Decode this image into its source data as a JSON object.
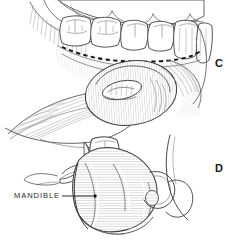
{
  "figure": {
    "background_color": "#ffffff",
    "ink_color": "#333333",
    "width": 234,
    "height": 245
  },
  "panels": [
    {
      "id": "C",
      "letter": "C",
      "description": "Intraoral view of mandibular dental arch with dashed incision line along the lingual gingival margin and hatched tongue mass in the floor of the mouth"
    },
    {
      "id": "D",
      "letter": "D",
      "description": "Lateral view of the mandibular ramus and body with single molar tooth, hatched muscle attachment, and looping neurovascular structure"
    }
  ],
  "annotations": [
    {
      "id": "mandible",
      "label": "MANDIBLE",
      "panel": "D",
      "leader": {
        "from_x": 62,
        "from_y": 196,
        "to_x": 93,
        "to_y": 196,
        "dot_x": 95,
        "dot_y": 196
      }
    }
  ],
  "features": {
    "incision_line_style": "dashed",
    "shading_style": "line-hatching",
    "tooth_count_panel_c": 6,
    "tooth_count_panel_d": 1
  }
}
